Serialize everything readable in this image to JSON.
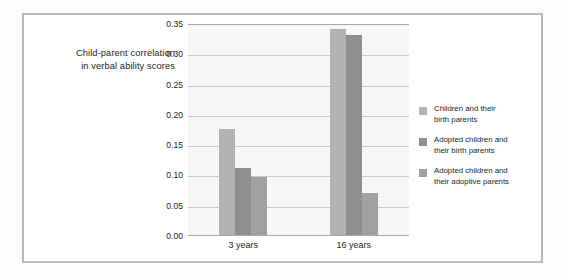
{
  "chart_data": {
    "type": "bar",
    "title": "",
    "xlabel": "",
    "ylabel": "Child-parent correlation in verbal ability scores",
    "ylabel_lines": [
      "Child-parent correlation",
      "in verbal ability scores"
    ],
    "categories": [
      "3 years",
      "16 years"
    ],
    "ylim": [
      0.0,
      0.35
    ],
    "yticks": [
      "0.00",
      "0.05",
      "0.10",
      "0.15",
      "0.20",
      "0.25",
      "0.30",
      "0.35"
    ],
    "ytick_values": [
      0.0,
      0.05,
      0.1,
      0.15,
      0.2,
      0.25,
      0.3,
      0.35
    ],
    "grid": true,
    "legend_position": "right",
    "series": [
      {
        "name": "Children and their birth parents",
        "name_lines": [
          "Children and their",
          "birth parents"
        ],
        "color": "#b3b3b3",
        "values": [
          0.175,
          0.34
        ]
      },
      {
        "name": "Adopted children and their birth parents",
        "name_lines": [
          "Adopted children and",
          "their birth parents"
        ],
        "color": "#8f8f8f",
        "values": [
          0.11,
          0.33
        ]
      },
      {
        "name": "Adopted children and their adoptive parents",
        "name_lines": [
          "Adopted children and",
          "their adoptive parents"
        ],
        "color": "#a1a1a1",
        "values": [
          0.095,
          0.07
        ]
      }
    ]
  },
  "colors": {
    "frame_border": "#b9b9b9",
    "plot_background": "#f7f7f7",
    "gridline": "#c8c8c8",
    "axis_line": "#a8a8a8",
    "text": "#231f20"
  }
}
